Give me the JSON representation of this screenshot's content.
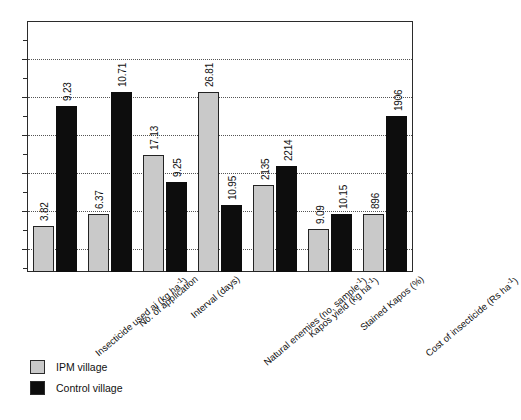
{
  "chart_data": {
    "type": "bar",
    "title": "",
    "subtitle": "",
    "xlabel": "",
    "ylabel": "",
    "grid": true,
    "legend_position": "bottom-left",
    "axis_note": "Y axis unlabeled; tick marks only. Bars share a common plot area although series units differ per category.",
    "categories": [
      "Insecticide used ai (kg ha⁻¹)",
      "No. of application",
      "Interval (days)",
      "Natural enemies (no. sample⁻¹)",
      "Kapos yield (kg ha⁻¹)",
      "Stained Kapos (%)",
      "Cost of insecticide (Rs ha⁻¹)"
    ],
    "series": [
      {
        "name": "IPM village",
        "color": "#c9c9c9",
        "values": [
          3.82,
          6.37,
          17.13,
          26.81,
          2135,
          9.09,
          896
        ],
        "labels": [
          "3.82",
          "6.37",
          "17.13",
          "26.81",
          "2135",
          "9.09",
          "896"
        ],
        "bar_heights_px": [
          46,
          58,
          117,
          180,
          87,
          43,
          58
        ]
      },
      {
        "name": "Control village",
        "color": "#0d0d0d",
        "values": [
          9.23,
          10.71,
          9.25,
          10.95,
          2214,
          10.15,
          1906
        ],
        "labels": [
          "9.23",
          "10.71",
          "9.25",
          "10.95",
          "2214",
          "10.15",
          "1906"
        ],
        "bar_heights_px": [
          166,
          180,
          90,
          67,
          106,
          58,
          156
        ]
      }
    ],
    "gridline_count": 6,
    "gridlines_px_from_top": [
      37,
      75,
      113,
      151,
      189,
      227
    ],
    "ytick_count": 13
  },
  "legend": {
    "items": [
      {
        "label": "IPM village",
        "color": "#c9c9c9"
      },
      {
        "label": "Control village",
        "color": "#0d0d0d"
      }
    ]
  },
  "colors": {
    "ipm": "#c9c9c9",
    "control": "#0d0d0d",
    "frame": "#2b2b2b",
    "grid": "#555555",
    "background": "#ffffff"
  }
}
